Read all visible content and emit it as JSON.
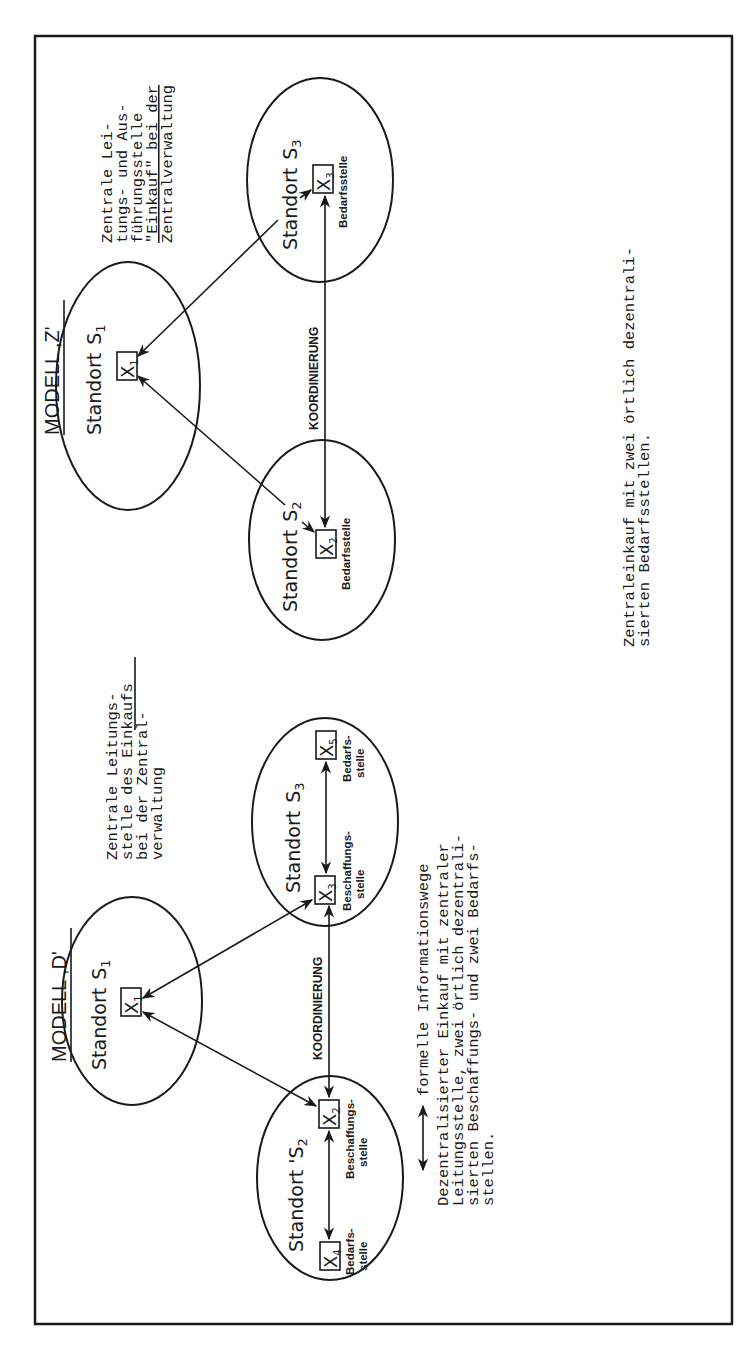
{
  "colors": {
    "ink": "#1a1a1a",
    "paper": "#ffffff"
  },
  "model_z": {
    "title": "MODELL ,Z'",
    "standort_s1": {
      "label": "Standort",
      "sub": "S",
      "index": "1",
      "node": "X",
      "node_index": "1"
    },
    "standort_s2": {
      "label": "Standort",
      "sub": "S",
      "index": "2",
      "node": "X",
      "node_index": "2",
      "role": "Bedarfsstelle"
    },
    "standort_s3": {
      "label": "Standort",
      "sub": "S",
      "index": "3",
      "node": "X",
      "node_index": "3",
      "role": "Bedarfsstelle"
    },
    "coordination_label": "KOORDINIERUNG",
    "central_note": [
      "Zentrale Lei-",
      "tungs- und Aus-",
      "führungsstelle",
      "\"Einkauf\" bei der",
      "Zentralverwaltung"
    ],
    "caption": [
      "Zentraleinkauf mit zwei örtlich dezentrali-",
      "sierten Bedarfsstellen."
    ]
  },
  "model_d": {
    "title": "MODELL ,D'",
    "standort_s1": {
      "label": "Standort",
      "sub": "S",
      "index": "1",
      "node": "X",
      "node_index": "1"
    },
    "standort_s2": {
      "label": "Standort 'S",
      "index": "2",
      "node_a": "X",
      "node_a_index": "2",
      "role_a": [
        "Beschaffungs-",
        "stelle"
      ],
      "node_b": "X",
      "node_b_index": "4",
      "role_b": [
        "Bedarfs-",
        "stelle"
      ]
    },
    "standort_s3": {
      "label": "Standort",
      "sub": "S",
      "index": "3",
      "node_a": "X",
      "node_a_index": "3",
      "role_a": [
        "Beschaffungs-",
        "stelle"
      ],
      "node_b": "X",
      "node_b_index": "5",
      "role_b": [
        "Bedarfs-",
        "stelle"
      ]
    },
    "coordination_label": "KOORDINIERUNG",
    "central_note": [
      "Zentrale Leitungs-",
      "stelle des Einkaufs",
      "bei der Zentral-",
      "verwaltung"
    ],
    "legend": {
      "icon": "double-arrow-icon",
      "label": "formelle Informationswege"
    },
    "caption": [
      "Dezentralisierter Einkauf mit zentraler",
      "Leitungsstelle, zwei örtlich dezentrali-",
      "sierten Beschaffungs- und zwei Bedarfs-",
      "stellen."
    ]
  }
}
